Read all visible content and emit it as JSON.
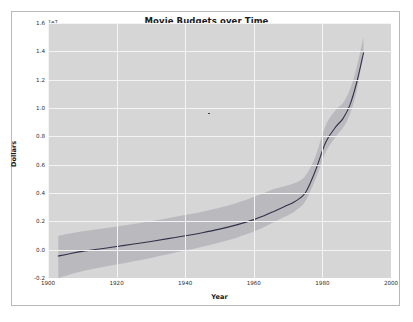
{
  "figure": {
    "title": "Movie Budgets over Time",
    "offset_text": "1e7",
    "xlabel": "Year",
    "ylabel": "Dollars"
  },
  "style": {
    "plot_background": "#d6d6d6",
    "grid_color": "#f4f4f4",
    "line_color": "#31314a",
    "band_color": "#a9a9b0",
    "figure_background": "#ffffff",
    "figure_border": "#b9b9b9",
    "text_color": "#2d2d2d"
  },
  "axes": {
    "xlim": [
      1900,
      2000
    ],
    "ylim": [
      -0.2,
      1.6
    ],
    "y_scale_note": "values in units of 1e7 dollars",
    "grid": true,
    "legend": "none",
    "xticks": [
      {
        "value": 1900,
        "label": "1900"
      },
      {
        "value": 1920,
        "label": "1920"
      },
      {
        "value": 1940,
        "label": "1940"
      },
      {
        "value": 1960,
        "label": "1960"
      },
      {
        "value": 1980,
        "label": "1980"
      },
      {
        "value": 2000,
        "label": "2000"
      }
    ],
    "yticks": [
      {
        "value": 1.6,
        "label": "1.6"
      },
      {
        "value": 1.4,
        "label": "1.4"
      },
      {
        "value": 1.2,
        "label": "1.2"
      },
      {
        "value": 1.0,
        "label": "1.0"
      },
      {
        "value": 0.8,
        "label": "0.8"
      },
      {
        "value": 0.6,
        "label": "0.6"
      },
      {
        "value": 0.4,
        "label": "0.4"
      },
      {
        "value": 0.2,
        "label": "0.2"
      },
      {
        "value": 0.0,
        "label": "0.0"
      },
      {
        "value": -0.2,
        "label": "-0.2"
      }
    ]
  },
  "chart_data": {
    "type": "line",
    "title": "Movie Budgets over Time",
    "xlabel": "Year",
    "ylabel": "Dollars",
    "offset_text": "1e7",
    "xlim": [
      1900,
      2000
    ],
    "ylim": [
      -0.2,
      1.6
    ],
    "grid": true,
    "legend": "none",
    "x": [
      1903,
      1906,
      1910,
      1915,
      1920,
      1925,
      1930,
      1935,
      1940,
      1945,
      1950,
      1955,
      1960,
      1963,
      1966,
      1969,
      1972,
      1975,
      1978,
      1981,
      1984,
      1986,
      1988,
      1990,
      1992
    ],
    "series": [
      {
        "name": "mean budget",
        "values": [
          -0.045,
          -0.03,
          -0.012,
          0.005,
          0.022,
          0.04,
          0.058,
          0.078,
          0.098,
          0.12,
          0.145,
          0.175,
          0.212,
          0.24,
          0.272,
          0.305,
          0.34,
          0.4,
          0.56,
          0.76,
          0.87,
          0.925,
          1.02,
          1.18,
          1.39
        ]
      }
    ],
    "confidence_band": {
      "name": "confidence interval",
      "lower": [
        -0.2,
        -0.178,
        -0.152,
        -0.128,
        -0.105,
        -0.082,
        -0.058,
        -0.032,
        -0.006,
        0.02,
        0.05,
        0.085,
        0.128,
        0.16,
        0.196,
        0.232,
        0.272,
        0.34,
        0.498,
        0.69,
        0.8,
        0.86,
        0.955,
        1.12,
        1.39
      ],
      "upper": [
        0.098,
        0.112,
        0.13,
        0.146,
        0.164,
        0.182,
        0.2,
        0.222,
        0.244,
        0.268,
        0.296,
        0.33,
        0.372,
        0.4,
        0.43,
        0.448,
        0.47,
        0.52,
        0.66,
        0.88,
        0.99,
        1.035,
        1.13,
        1.29,
        1.505
      ]
    },
    "annotations": [
      {
        "name": "outlier-point",
        "x": 1947,
        "y": 0.96
      }
    ]
  }
}
